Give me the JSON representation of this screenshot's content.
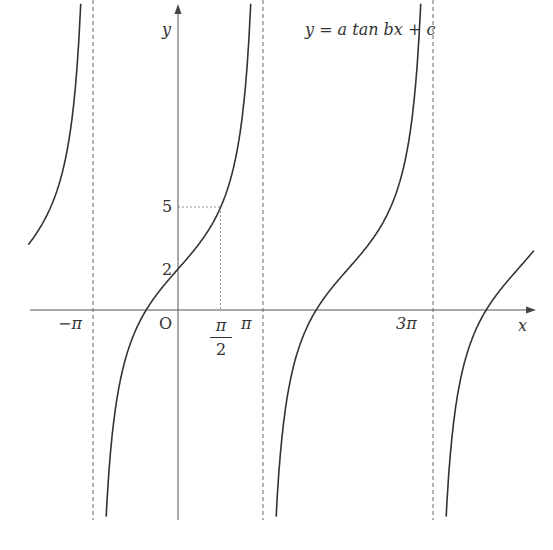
{
  "chart_data": {
    "type": "line",
    "title": "y = a tan bx + c",
    "function": "y = 3 tan(x/2) + 2",
    "parameters": {
      "a": 3,
      "b": 0.5,
      "c": 2
    },
    "xlabel": "x",
    "ylabel": "y",
    "origin_label": "O",
    "x_tick_labels": [
      "−π",
      "π/2",
      "π",
      "3π"
    ],
    "y_tick_labels": [
      "2",
      "5"
    ],
    "asymptotes_x": [
      "−π",
      "π",
      "3π"
    ],
    "marked_point": {
      "x": "π/2",
      "y": 5
    },
    "y_intercept": 2,
    "period": "2π",
    "grid": false,
    "legend": null
  },
  "labels": {
    "equation": "y = a tan bx + c",
    "x_axis": "x",
    "y_axis": "y",
    "origin": "O",
    "neg_pi": "−π",
    "pi": "π",
    "three_pi": "3π",
    "half_pi_num": "π",
    "half_pi_den": "2",
    "y5": "5",
    "y2": "2"
  },
  "style": {
    "curve_color": "#333333",
    "axis_color": "#555555"
  }
}
